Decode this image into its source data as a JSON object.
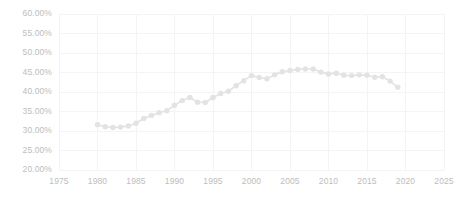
{
  "chart_data": {
    "type": "line",
    "title": "",
    "subtitle": "",
    "xlabel": "",
    "ylabel": "",
    "xlim": [
      1975,
      2025
    ],
    "ylim": [
      20,
      60
    ],
    "grid": true,
    "legend_position": "none",
    "x_tick_labels": [
      "1975",
      "1980",
      "1985",
      "1990",
      "1995",
      "2000",
      "2005",
      "2010",
      "2015",
      "2020",
      "2025"
    ],
    "x_ticks": [
      1975,
      1980,
      1985,
      1990,
      1995,
      2000,
      2005,
      2010,
      2015,
      2020,
      2025
    ],
    "y_tick_labels": [
      "20.00%",
      "25.00%",
      "30.00%",
      "35.00%",
      "40.00%",
      "45.00%",
      "50.00%",
      "55.00%",
      "60.00%"
    ],
    "y_ticks": [
      20,
      25,
      30,
      35,
      40,
      45,
      50,
      55,
      60
    ],
    "y_unit": "%",
    "marker": "circle",
    "series_color": "#e3e3e3",
    "grid_color": "#f4f4f4",
    "tick_label_color": "#bdbdbd",
    "series": [
      {
        "name": "Series 1",
        "x": [
          1980,
          1981,
          1982,
          1983,
          1984,
          1985,
          1986,
          1987,
          1988,
          1989,
          1990,
          1991,
          1992,
          1993,
          1994,
          1995,
          1996,
          1997,
          1998,
          1999,
          2000,
          2001,
          2002,
          2003,
          2004,
          2005,
          2006,
          2007,
          2008,
          2009,
          2010,
          2011,
          2012,
          2013,
          2014,
          2015,
          2016,
          2017,
          2018,
          2019
        ],
        "values": [
          31.6,
          31.1,
          30.9,
          31.0,
          31.3,
          32.0,
          33.2,
          34.0,
          34.7,
          35.2,
          36.6,
          37.8,
          38.6,
          37.4,
          37.3,
          38.6,
          39.6,
          40.2,
          41.6,
          42.9,
          44.2,
          43.7,
          43.4,
          44.4,
          45.2,
          45.5,
          45.8,
          45.9,
          45.9,
          45.1,
          44.6,
          44.8,
          44.3,
          44.2,
          44.4,
          44.3,
          43.8,
          43.9,
          42.8,
          41.2
        ]
      }
    ]
  }
}
